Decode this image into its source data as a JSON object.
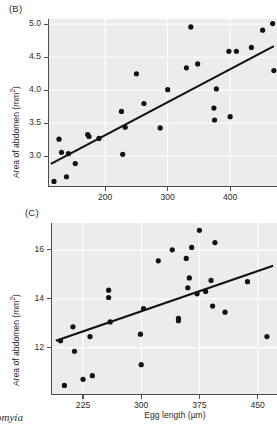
{
  "figure": {
    "caption_genus": "omyia"
  },
  "panels": [
    {
      "label": "(B)",
      "ylabel_text": "Area of abdomen (mm",
      "ylabel_sup": "2",
      "ylabel_close": ")",
      "xlabel": "",
      "chart_data": {
        "type": "scatter",
        "title": "(B)",
        "xlabel": "Egg length (µm)",
        "ylabel": "Area of abdomen (mm²)",
        "xlim": [
          110,
          475
        ],
        "ylim": [
          2.55,
          5.08
        ],
        "xticks": [
          200,
          300,
          400
        ],
        "yticks": [
          3.0,
          3.5,
          4.0,
          4.5,
          5.0
        ],
        "xticklabels": [
          "200",
          "300",
          "400"
        ],
        "yticklabels": [
          "3.0",
          "3.5",
          "4.0",
          "4.5",
          "5.0"
        ],
        "grid": true,
        "legend": "none",
        "points": [
          [
            118,
            2.62
          ],
          [
            126,
            3.26
          ],
          [
            130,
            3.06
          ],
          [
            138,
            2.69
          ],
          [
            141,
            3.04
          ],
          [
            152,
            2.89
          ],
          [
            172,
            3.33
          ],
          [
            174,
            3.3
          ],
          [
            190,
            3.27
          ],
          [
            226,
            3.68
          ],
          [
            228,
            3.03
          ],
          [
            232,
            3.44
          ],
          [
            250,
            4.25
          ],
          [
            262,
            3.8
          ],
          [
            288,
            3.43
          ],
          [
            300,
            4.01
          ],
          [
            330,
            4.34
          ],
          [
            337,
            4.96
          ],
          [
            348,
            4.4
          ],
          [
            374,
            3.73
          ],
          [
            375,
            3.55
          ],
          [
            378,
            4.02
          ],
          [
            398,
            4.59
          ],
          [
            400,
            3.6
          ],
          [
            410,
            4.59
          ],
          [
            434,
            4.65
          ],
          [
            452,
            4.91
          ],
          [
            468,
            5.01
          ],
          [
            470,
            4.3
          ]
        ],
        "trendline": {
          "x": [
            113,
            470
          ],
          "y": [
            2.885,
            4.67
          ]
        }
      }
    },
    {
      "label": "(C)",
      "ylabel_text": "Area of abdomen (mm",
      "ylabel_sup": "2",
      "ylabel_close": ")",
      "xlabel": "Egg length (µm)",
      "chart_data": {
        "type": "scatter",
        "title": "(C)",
        "xlabel": "Egg length (µm)",
        "ylabel": "Area of abdomen (mm²)",
        "xlim": [
          185,
          475
        ],
        "ylim": [
          10.1,
          17.1
        ],
        "xticks": [
          225,
          300,
          375,
          450
        ],
        "yticks": [
          12,
          14,
          16
        ],
        "xticklabels": [
          "225",
          "300",
          "375",
          "450"
        ],
        "yticklabels": [
          "12",
          "14",
          "16"
        ],
        "grid": true,
        "legend": "none",
        "points": [
          [
            196,
            12.28
          ],
          [
            201,
            10.45
          ],
          [
            212,
            12.85
          ],
          [
            214,
            11.85
          ],
          [
            225,
            10.7
          ],
          [
            234,
            12.45
          ],
          [
            237,
            10.85
          ],
          [
            258,
            14.35
          ],
          [
            258,
            14.05
          ],
          [
            260,
            13.05
          ],
          [
            299,
            12.55
          ],
          [
            300,
            11.3
          ],
          [
            303,
            13.6
          ],
          [
            322,
            15.55
          ],
          [
            340,
            16.0
          ],
          [
            348,
            13.2
          ],
          [
            348,
            13.1
          ],
          [
            358,
            15.65
          ],
          [
            360,
            14.45
          ],
          [
            362,
            14.85
          ],
          [
            365,
            16.1
          ],
          [
            372,
            14.2
          ],
          [
            375,
            16.8
          ],
          [
            383,
            14.3
          ],
          [
            390,
            14.75
          ],
          [
            392,
            13.7
          ],
          [
            395,
            16.3
          ],
          [
            408,
            13.45
          ],
          [
            437,
            14.7
          ],
          [
            462,
            12.45
          ]
        ],
        "trendline": {
          "x": [
            190,
            470
          ],
          "y": [
            12.28,
            15.35
          ]
        }
      }
    }
  ]
}
